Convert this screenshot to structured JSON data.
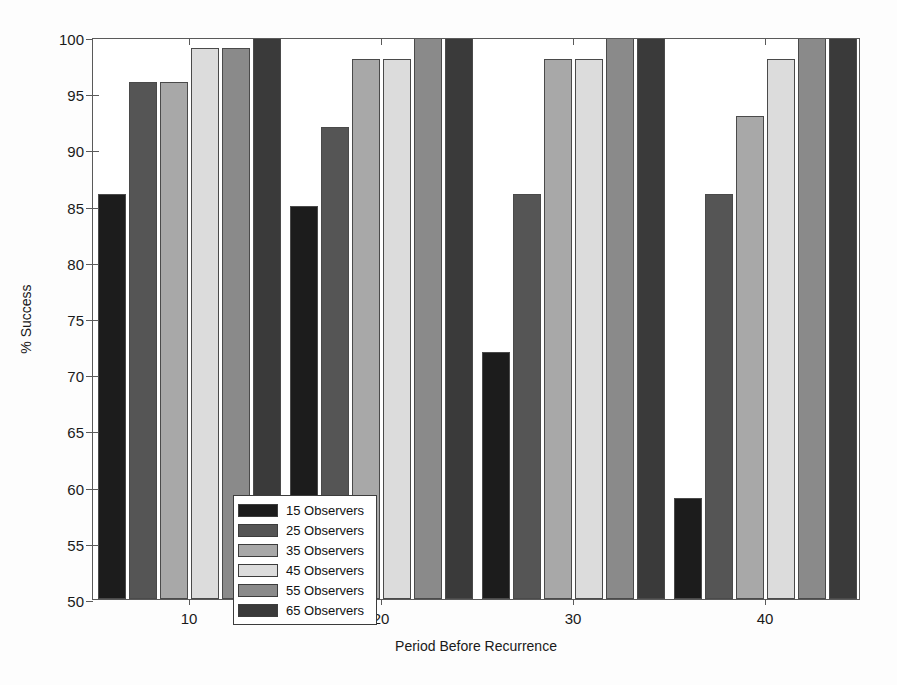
{
  "chart_data": {
    "type": "bar",
    "title": "",
    "xlabel": "Period Before Recurrence",
    "ylabel": "% Success",
    "categories": [
      "10",
      "20",
      "30",
      "40"
    ],
    "ylim": [
      50,
      100
    ],
    "yticks": [
      50,
      55,
      60,
      65,
      70,
      75,
      80,
      85,
      90,
      95,
      100
    ],
    "ytick_labels": [
      "50",
      "55",
      "60",
      "65",
      "70",
      "75",
      "80",
      "85",
      "90",
      "95",
      "100"
    ],
    "grid": false,
    "legend_position": "lower left inside axes",
    "series": [
      {
        "name": "15 Observers",
        "color": "#1c1c1c",
        "values": [
          86,
          85,
          72,
          59
        ]
      },
      {
        "name": "25 Observers",
        "color": "#555555",
        "values": [
          96,
          92,
          86,
          86
        ]
      },
      {
        "name": "35 Observers",
        "color": "#a8a8a8",
        "values": [
          96,
          98,
          98,
          93
        ]
      },
      {
        "name": "45 Observers",
        "color": "#dcdcdc",
        "values": [
          99,
          98,
          98,
          98
        ]
      },
      {
        "name": "55 Observers",
        "color": "#8a8a8a",
        "values": [
          99,
          100,
          100,
          100
        ]
      },
      {
        "name": "65 Observers",
        "color": "#3a3a3a",
        "values": [
          100,
          100,
          100,
          100
        ]
      }
    ]
  },
  "axes": {
    "y_title": "% Success",
    "x_title": "Period Before Recurrence"
  },
  "legend": {
    "entries": [
      {
        "label": "15 Observers"
      },
      {
        "label": "25 Observers"
      },
      {
        "label": "35 Observers"
      },
      {
        "label": "45 Observers"
      },
      {
        "label": "55 Observers"
      },
      {
        "label": "65 Observers"
      }
    ]
  }
}
